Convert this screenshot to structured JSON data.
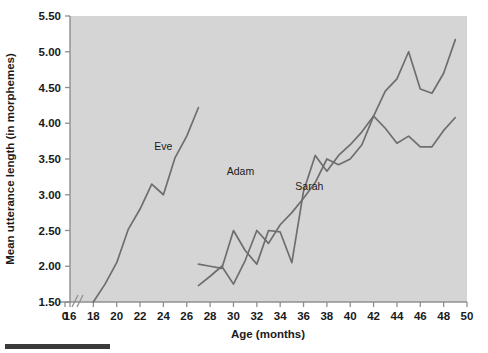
{
  "chart_data": {
    "type": "line",
    "title": "",
    "xlabel": "Age (months)",
    "ylabel": "Mean utterance length (in morphemes)",
    "xlim": [
      16,
      50
    ],
    "ylim": [
      1.5,
      5.5
    ],
    "xticks": [
      0,
      16,
      18,
      20,
      22,
      24,
      26,
      28,
      30,
      32,
      34,
      36,
      38,
      40,
      42,
      44,
      46,
      48,
      50
    ],
    "xticklabels": [
      "0",
      "16",
      "18",
      "20",
      "22",
      "24",
      "26",
      "28",
      "30",
      "32",
      "34",
      "36",
      "38",
      "40",
      "42",
      "44",
      "46",
      "48",
      "50"
    ],
    "yticks": [
      1.5,
      2.0,
      2.5,
      3.0,
      3.5,
      4.0,
      4.5,
      5.0,
      5.5
    ],
    "yticklabels": [
      "1.50",
      "2.00",
      "2.50",
      "3.00",
      "3.50",
      "4.00",
      "4.50",
      "5.00",
      "5.50"
    ],
    "axis_break": {
      "axis": "x",
      "between": [
        0,
        16
      ]
    },
    "grid": false,
    "legend_position": "inline-annotations",
    "series": [
      {
        "name": "Eve",
        "label_x": 24.0,
        "label_y": 3.62,
        "x": [
          18,
          19,
          20,
          21,
          22,
          23,
          24,
          25,
          26,
          27
        ],
        "y": [
          1.5,
          1.75,
          2.05,
          2.52,
          2.8,
          3.15,
          3.0,
          3.52,
          3.82,
          4.22
        ]
      },
      {
        "name": "Adam",
        "label_x": 30.6,
        "label_y": 3.28,
        "x": [
          27,
          28,
          29,
          30,
          31,
          32,
          33,
          34,
          35,
          36,
          37,
          38,
          39,
          40,
          41,
          42,
          43,
          44,
          45,
          46,
          47,
          48,
          49
        ],
        "y": [
          2.03,
          2.0,
          1.97,
          2.5,
          2.22,
          2.03,
          2.5,
          2.48,
          2.05,
          3.05,
          3.55,
          3.33,
          3.55,
          3.7,
          3.88,
          4.1,
          4.45,
          4.62,
          5.0,
          4.48,
          4.42,
          4.7,
          5.17
        ]
      },
      {
        "name": "Sarah",
        "label_x": 36.5,
        "label_y": 3.06,
        "x": [
          27,
          28,
          29,
          30,
          31,
          32,
          33,
          34,
          35,
          36,
          37,
          38,
          39,
          40,
          41,
          42,
          43,
          44,
          45,
          46,
          47,
          48,
          49
        ],
        "y": [
          1.73,
          1.86,
          2.0,
          1.75,
          2.08,
          2.5,
          2.32,
          2.58,
          2.75,
          2.95,
          3.17,
          3.5,
          3.42,
          3.5,
          3.7,
          4.1,
          3.93,
          3.72,
          3.82,
          3.67,
          3.67,
          3.9,
          4.08
        ]
      }
    ]
  },
  "colors": {
    "plot_background": "#d5d5d5",
    "line": "#6e6e6e",
    "axis": "#8f8f8f",
    "text": "#1a1a1a",
    "footer_bar": "#3a3a3a"
  },
  "footer": {
    "bar_present": true
  }
}
